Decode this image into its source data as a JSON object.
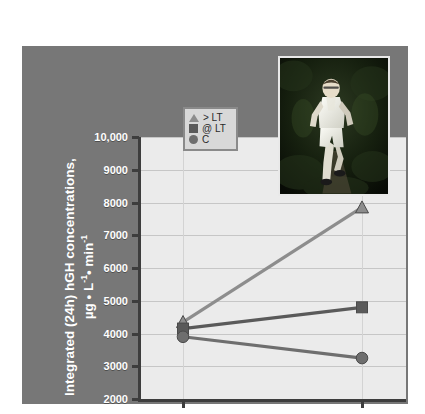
{
  "figure": {
    "panel_color": "#777777",
    "plot_bg_color": "#ebebeb",
    "axis_color": "#3d3d3d",
    "label_color": "#ffffff"
  },
  "legend": {
    "position": "top-center-inside",
    "items": [
      {
        "marker": "triangle-marker",
        "label": "> LT",
        "color": "#8d8d8d"
      },
      {
        "marker": "square-marker",
        "label": "@ LT",
        "color": "#5a5a5a"
      },
      {
        "marker": "circle-marker",
        "label": "C",
        "color": "#6e6e6e"
      }
    ]
  },
  "photo": {
    "name": "runner-photo",
    "alt": "Photograph of a runner on a wooded trail"
  },
  "chart_data": {
    "type": "line",
    "title": "",
    "categories": [
      "Baseline",
      "1 year"
    ],
    "x": [
      "Baseline",
      "1 year"
    ],
    "xlabel": "Time",
    "ylabel": "Integrated (24h) hGH concentrations, µg • L⁻¹• min⁻¹",
    "ylabel_line1": "Integrated (24h) hGH concentrations,",
    "ylabel_line2_pre": "µg • L",
    "ylabel_line2_sup1": "-1",
    "ylabel_line2_mid": "• min",
    "ylabel_line2_sup2": "-1",
    "ylim": [
      2000,
      10000
    ],
    "ytick_values": [
      2000,
      3000,
      4000,
      5000,
      6000,
      7000,
      8000,
      9000,
      10000
    ],
    "ytick_labels": [
      "2000",
      "3000",
      "4000",
      "5000",
      "6000",
      "7000",
      "8000",
      "9000",
      "10,000"
    ],
    "grid": true,
    "legend_position": "upper center",
    "series": [
      {
        "name": "> LT",
        "marker": "triangle",
        "color": "#8d8d8d",
        "values": [
          4350,
          7850
        ]
      },
      {
        "name": "@ LT",
        "marker": "square",
        "color": "#5a5a5a",
        "values": [
          4150,
          4800
        ]
      },
      {
        "name": "C",
        "marker": "circle",
        "color": "#6e6e6e",
        "values": [
          3900,
          3250
        ]
      }
    ]
  }
}
